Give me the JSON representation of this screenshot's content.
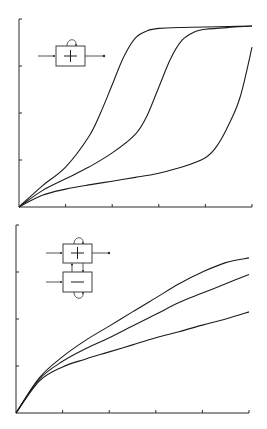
{
  "chart_data": [
    {
      "type": "line",
      "title": "",
      "xlabel": "",
      "ylabel": "",
      "xlim": [
        0,
        5
      ],
      "ylim": [
        0,
        4
      ],
      "x_ticks": 5,
      "y_ticks": 4,
      "grid": false,
      "legend": "none",
      "inset_diagram": {
        "name": "positive-feedback-block",
        "blocks": [
          {
            "sign": "+",
            "self_loop": true
          }
        ],
        "input_arrow": true,
        "output_arrow": true
      },
      "series": [
        {
          "name": "curve-1",
          "x": [
            0,
            0.5,
            1.0,
            1.5,
            1.75,
            2.0,
            2.25,
            2.5,
            2.75,
            3.0,
            3.5,
            4.0,
            4.5,
            5.0
          ],
          "y": [
            0,
            0.45,
            0.85,
            1.5,
            2.0,
            2.6,
            3.2,
            3.6,
            3.75,
            3.8,
            3.82,
            3.83,
            3.84,
            3.85
          ]
        },
        {
          "name": "curve-2",
          "x": [
            0,
            0.5,
            1.0,
            1.5,
            2.0,
            2.5,
            2.75,
            3.0,
            3.25,
            3.5,
            3.75,
            4.0,
            4.5,
            5.0
          ],
          "y": [
            0,
            0.35,
            0.6,
            0.85,
            1.15,
            1.55,
            1.95,
            2.55,
            3.15,
            3.55,
            3.72,
            3.78,
            3.82,
            3.85
          ]
        },
        {
          "name": "curve-3",
          "x": [
            0,
            0.5,
            1.0,
            1.5,
            2.0,
            2.5,
            3.0,
            3.5,
            4.0,
            4.25,
            4.5,
            4.75,
            5.0
          ],
          "y": [
            0,
            0.25,
            0.38,
            0.47,
            0.55,
            0.63,
            0.72,
            0.85,
            1.05,
            1.3,
            1.75,
            2.35,
            3.4
          ]
        }
      ]
    },
    {
      "type": "line",
      "title": "",
      "xlabel": "",
      "ylabel": "",
      "xlim": [
        0,
        5
      ],
      "ylim": [
        0,
        4
      ],
      "x_ticks": 5,
      "y_ticks": 4,
      "grid": false,
      "legend": "none",
      "inset_diagram": {
        "name": "coupled-positive-negative-blocks",
        "blocks": [
          {
            "sign": "+",
            "self_loop": true
          },
          {
            "sign": "−",
            "self_loop": true
          }
        ],
        "input_arrow": true,
        "output_arrow": true,
        "cross_coupling": true
      },
      "series": [
        {
          "name": "curve-1",
          "x": [
            0,
            0.5,
            1.0,
            1.5,
            2.0,
            2.5,
            3.0,
            3.5,
            4.0,
            4.5,
            5.0
          ],
          "y": [
            0,
            0.75,
            1.2,
            1.55,
            1.85,
            2.15,
            2.45,
            2.75,
            3.0,
            3.2,
            3.3
          ]
        },
        {
          "name": "curve-2",
          "x": [
            0,
            0.5,
            1.0,
            1.5,
            2.0,
            2.5,
            3.0,
            3.5,
            4.0,
            4.5,
            5.0
          ],
          "y": [
            0,
            0.72,
            1.1,
            1.37,
            1.6,
            1.85,
            2.1,
            2.35,
            2.55,
            2.75,
            2.95
          ]
        },
        {
          "name": "curve-3",
          "x": [
            0,
            0.5,
            1.0,
            1.5,
            2.0,
            2.5,
            3.0,
            3.5,
            4.0,
            4.5,
            5.0
          ],
          "y": [
            0,
            0.68,
            0.98,
            1.15,
            1.3,
            1.45,
            1.6,
            1.73,
            1.87,
            2.0,
            2.15
          ]
        }
      ]
    }
  ]
}
